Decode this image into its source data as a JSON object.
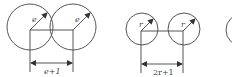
{
  "diagram": {
    "left_figure": {
      "radius_label": "e",
      "dimension_label": "e+1",
      "circles": [
        {
          "cx": 30,
          "cy": 27,
          "r": 23
        },
        {
          "cx": 73,
          "cy": 27,
          "r": 23
        }
      ]
    },
    "middle_figure": {
      "radius_label": "r",
      "dimension_label": "2r+1",
      "circles": [
        {
          "cx": 142,
          "cy": 29,
          "r": 16
        },
        {
          "cx": 184,
          "cy": 29,
          "r": 16
        }
      ]
    },
    "right_figure": {
      "partial_circle": true
    },
    "colors": {
      "stroke": "#555555",
      "text": "#444444"
    }
  }
}
